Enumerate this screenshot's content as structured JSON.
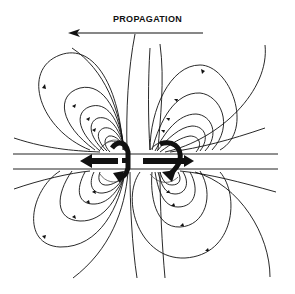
{
  "diagram": {
    "title": "PROPAGATION",
    "propagation_direction": "left",
    "colors": {
      "ink": "#111111",
      "background": "#ffffff"
    },
    "elements": {
      "propagation_arrow": "arrow-left-icon",
      "field_lines_upper": 6,
      "field_lines_lower": 6,
      "current_arrows": [
        "left-arrow",
        "right-arrow",
        "curved-arrow-left",
        "curved-arrow-right"
      ]
    }
  }
}
